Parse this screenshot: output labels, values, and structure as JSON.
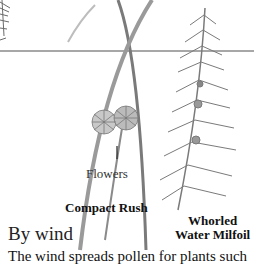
{
  "illustration": {
    "labels": {
      "flowers": "Flowers",
      "compact_rush": "Compact Rush",
      "milfoil_line1": "Whorled",
      "milfoil_line2": "Water Milfoil"
    },
    "colors": {
      "water_line": "#8a8a8a",
      "plant": "#7a7a7a"
    }
  },
  "section": {
    "heading": "By wind",
    "body": "The wind spreads pollen for plants such"
  }
}
